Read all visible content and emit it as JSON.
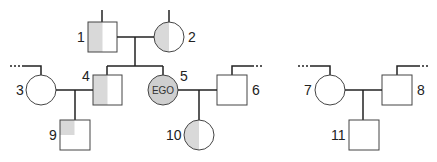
{
  "diagram": {
    "type": "genogram",
    "colors": {
      "line": "#222222",
      "shade": "#d9d9d9",
      "ego_fill": "#cfcfcf",
      "stroke": "#444444"
    },
    "people": [
      {
        "id": "1",
        "label": "1",
        "sex": "male",
        "shading": "left-half"
      },
      {
        "id": "2",
        "label": "2",
        "sex": "female",
        "shading": "left-half"
      },
      {
        "id": "3",
        "label": "3",
        "sex": "female",
        "shading": "none"
      },
      {
        "id": "4",
        "label": "4",
        "sex": "male",
        "shading": "left-half"
      },
      {
        "id": "5",
        "label": "5",
        "sex": "female",
        "shading": "full",
        "text": "EGO"
      },
      {
        "id": "6",
        "label": "6",
        "sex": "male",
        "shading": "none"
      },
      {
        "id": "7",
        "label": "7",
        "sex": "female",
        "shading": "none"
      },
      {
        "id": "8",
        "label": "8",
        "sex": "male",
        "shading": "none"
      },
      {
        "id": "9",
        "label": "9",
        "sex": "male",
        "shading": "top-left-quarter"
      },
      {
        "id": "10",
        "label": "10",
        "sex": "female",
        "shading": "left-half"
      },
      {
        "id": "11",
        "label": "11",
        "sex": "male",
        "shading": "none"
      }
    ],
    "unions": [
      {
        "partners": [
          "1",
          "2"
        ],
        "children": [
          "4",
          "5"
        ]
      },
      {
        "partners": [
          "3",
          "4"
        ],
        "children": [
          "9"
        ]
      },
      {
        "partners": [
          "5",
          "6"
        ],
        "children": [
          "10"
        ]
      },
      {
        "partners": [
          "7",
          "8"
        ],
        "children": [
          "11"
        ]
      }
    ]
  }
}
